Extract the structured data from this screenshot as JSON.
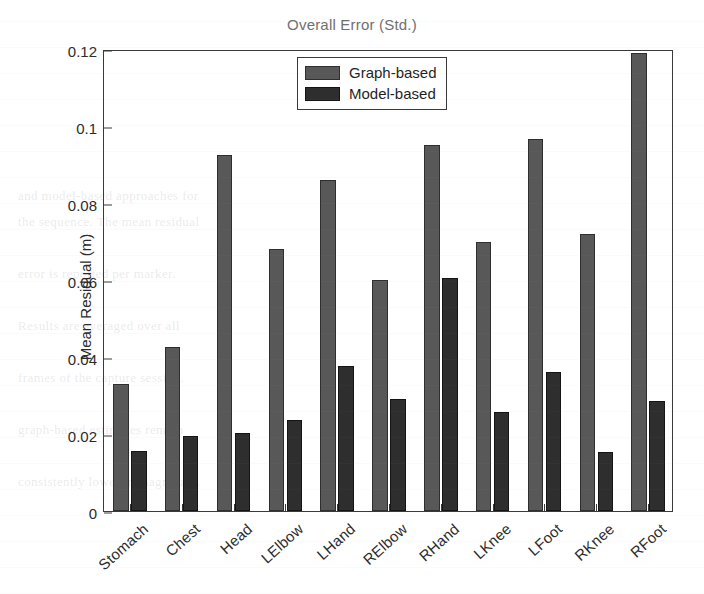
{
  "chart_data": {
    "type": "bar",
    "title": "Overall Error (Std.)",
    "xlabel": "",
    "ylabel": "Mean Residual (m)",
    "ylim": [
      0,
      0.12
    ],
    "yticks": [
      0,
      0.02,
      0.04,
      0.06,
      0.08,
      0.1,
      0.12
    ],
    "ytick_labels": [
      "0",
      "0.02",
      "0.04",
      "0.06",
      "0.08",
      "0.1",
      "0.12"
    ],
    "grid": false,
    "legend_position": "top-center",
    "categories": [
      "Stomach",
      "Chest",
      "Head",
      "LElbow",
      "LHand",
      "RElbow",
      "RHand",
      "LKnee",
      "LFoot",
      "RKnee",
      "RFoot"
    ],
    "series": [
      {
        "name": "Graph-based",
        "color": "#585858",
        "values": [
          0.033,
          0.0425,
          0.0925,
          0.068,
          0.086,
          0.06,
          0.095,
          0.07,
          0.0965,
          0.072,
          0.119
        ]
      },
      {
        "name": "Model-based",
        "color": "#2e2e2e",
        "values": [
          0.0155,
          0.0195,
          0.0202,
          0.0237,
          0.0377,
          0.0292,
          0.0605,
          0.0257,
          0.036,
          0.0153,
          0.0287
        ]
      }
    ]
  },
  "legend": {
    "items": [
      {
        "label": "Graph-based",
        "swatch": "series-0-swatch"
      },
      {
        "label": "Model-based",
        "swatch": "series-1-swatch"
      }
    ]
  },
  "background_text": {
    "lines": [
      "and model-based approaches for",
      "the sequence. The mean residual",
      "error is reported per marker.",
      "Results are averaged over all",
      "frames of the capture session.",
      "graph-based estimates remain",
      "consistently lower in magnitude."
    ]
  }
}
